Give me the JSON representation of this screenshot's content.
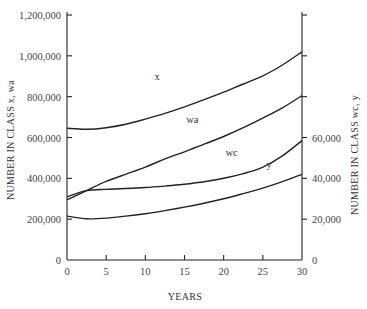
{
  "chart_data": {
    "type": "line",
    "title": "",
    "xlabel": "YEARS",
    "ylabel_left": "NUMBER IN CLASS x, wa",
    "ylabel_right": "NUMBER IN CLASS wc, y",
    "xlim": [
      0,
      30
    ],
    "ylim_left": [
      0,
      1200000
    ],
    "ylim_right": [
      0,
      120000
    ],
    "grid": false,
    "legend": "inline labels on curves",
    "x_ticks": [
      0,
      5,
      10,
      15,
      20,
      25,
      30
    ],
    "x_tick_labels": [
      "0",
      "5",
      "10",
      "15",
      "20",
      "25",
      "30"
    ],
    "y_left_ticks": [
      0,
      200000,
      400000,
      600000,
      800000,
      1000000,
      1200000
    ],
    "y_left_tick_labels": [
      "0",
      "200,000",
      "400,000",
      "600,000",
      "800,000",
      "1,000,000",
      "1,200,000"
    ],
    "y_right_ticks": [
      0,
      20000,
      40000,
      60000,
      80000,
      100000,
      120000
    ],
    "y_right_tick_labels": [
      "0",
      "20,000",
      "40,000",
      "60,000",
      "",
      "",
      ""
    ],
    "x": [
      0,
      2.5,
      5,
      7.5,
      10,
      12.5,
      15,
      17.5,
      20,
      22.5,
      25,
      27.5,
      30
    ],
    "series": [
      {
        "name": "x",
        "axis": "left",
        "label_pos": [
          11.5,
          0.735
        ],
        "values": [
          645000,
          640000,
          648000,
          665000,
          690000,
          718000,
          750000,
          785000,
          822000,
          862000,
          902000,
          955000,
          1020000
        ]
      },
      {
        "name": "wa",
        "axis": "left",
        "label_pos": [
          16.0,
          0.56
        ],
        "values": [
          295000,
          340000,
          385000,
          420000,
          455000,
          495000,
          530000,
          567000,
          605000,
          648000,
          695000,
          745000,
          805000
        ]
      },
      {
        "name": "wc",
        "axis": "right",
        "label_pos": [
          21.0,
          0.425
        ],
        "values": [
          31000,
          34000,
          34600,
          35000,
          35500,
          36200,
          37100,
          38300,
          40000,
          42300,
          45500,
          51000,
          58500
        ]
      },
      {
        "name": "y",
        "axis": "right",
        "label_pos": [
          25.8,
          0.375
        ],
        "values": [
          21500,
          20200,
          20500,
          21500,
          22700,
          24200,
          25900,
          27800,
          30000,
          32500,
          35200,
          38400,
          42000
        ]
      }
    ]
  }
}
